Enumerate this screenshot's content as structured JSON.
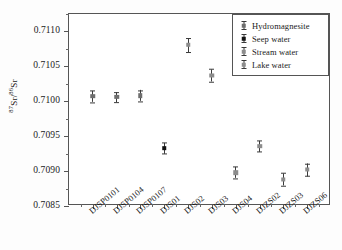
{
  "chart_data": {
    "type": "scatter",
    "title": "",
    "xlabel": "",
    "ylabel": "87Sr/86Sr",
    "ylabel_numerator": "87",
    "ylabel_denominator": "86",
    "ylabel_element": "Sr",
    "ylim": [
      0.7085,
      0.71125
    ],
    "ytick_labels": [
      "0.7085",
      "0.7090",
      "0.7095",
      "0.7100",
      "0.7105",
      "0.7110"
    ],
    "ytick_values": [
      0.7085,
      0.709,
      0.7095,
      0.71,
      0.7105,
      0.711
    ],
    "grid": false,
    "legend_position": "top-right",
    "categories": [
      "DJSP0101",
      "DJSP0104",
      "DJSP0107",
      "DJS01",
      "DJS02",
      "DJS03",
      "DJS04",
      "DJZS02",
      "DJZS03",
      "DJZS06"
    ],
    "series": [
      {
        "name": "Hydromagnesite",
        "marker": "errorbar-half",
        "color": "#6e6e6e",
        "points": [
          {
            "category": "DJSP0101",
            "value": 0.71007,
            "error": 8e-05
          },
          {
            "category": "DJSP0104",
            "value": 0.71006,
            "error": 7e-05
          },
          {
            "category": "DJSP0107",
            "value": 0.71008,
            "error": 8e-05
          }
        ]
      },
      {
        "name": "Seep water",
        "marker": "errorbar-filled",
        "color": "#111111",
        "points": [
          {
            "category": "DJS01",
            "value": 0.70933,
            "error": 8e-05
          }
        ]
      },
      {
        "name": "Stream water",
        "marker": "errorbar-open",
        "color": "#8c8c8c",
        "points": [
          {
            "category": "DJS02",
            "value": 0.71081,
            "error": 0.0001
          },
          {
            "category": "DJS03",
            "value": 0.71037,
            "error": 9e-05
          },
          {
            "category": "DJS04",
            "value": 0.70898,
            "error": 8e-05
          }
        ]
      },
      {
        "name": "Lake water",
        "marker": "errorbar-open",
        "color": "#8c8c8c",
        "points": [
          {
            "category": "DJZS02",
            "value": 0.70936,
            "error": 8e-05
          },
          {
            "category": "DJZS03",
            "value": 0.70888,
            "error": 9e-05
          },
          {
            "category": "DJZS06",
            "value": 0.70902,
            "error": 9e-05
          }
        ]
      }
    ]
  },
  "legend": {
    "items": [
      {
        "label": "Hydromagnesite"
      },
      {
        "label": "Seep water"
      },
      {
        "label": "Stream water"
      },
      {
        "label": "Lake water"
      }
    ]
  }
}
